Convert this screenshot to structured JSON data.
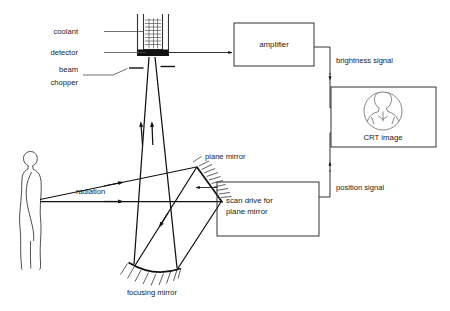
{
  "figure": {
    "background": "#ffffff",
    "ink": "#1a1a1a"
  },
  "labels": {
    "coolant": "coolant",
    "detector": "detector",
    "beam_chopper_line1": "beam",
    "beam_chopper_line2": "chopper",
    "radiation": "radiation",
    "plane_mirror": "plane mirror",
    "focusing_mirror": "focusing mirror",
    "brightness_signal": "brightness signal",
    "position_signal": "position signal"
  },
  "boxes": [
    {
      "id": "amplifier",
      "label": "amplifier",
      "x": 234,
      "y": 23,
      "width": 80,
      "height": 43
    },
    {
      "id": "crt-image",
      "label": "CRT image",
      "x": 331,
      "y": 87,
      "width": 105,
      "height": 60
    },
    {
      "id": "scan-drive",
      "label_line1": "scan drive for",
      "label_line2": "plane mirror",
      "x": 217,
      "y": 182,
      "width": 102,
      "height": 54
    }
  ],
  "components": {
    "coolant_vessel": {
      "name": "coolant vessel",
      "x": 137,
      "y": 14,
      "width": 32,
      "height": 42
    },
    "detector_bar": {
      "name": "detector bar",
      "color": "#111111"
    },
    "plane_mirror": {
      "name": "plane mirror",
      "hatched_side": "right"
    },
    "focusing_mirror": {
      "name": "focusing mirror (concave)",
      "hatched_side": "below"
    },
    "subject": {
      "name": "human subject in profile"
    },
    "crt_thermogram": {
      "name": "head and shoulders thermogram"
    }
  },
  "signal_paths": [
    {
      "id": "detector-to-amplifier",
      "from": "detector",
      "to": "amplifier",
      "label": ""
    },
    {
      "id": "amplifier-to-crt",
      "from": "amplifier",
      "to": "CRT image",
      "label": "brightness signal"
    },
    {
      "id": "scan-drive-to-crt",
      "from": "scan drive for plane mirror",
      "to": "CRT image",
      "label": "position signal"
    },
    {
      "id": "scan-drive-to-plane-mirror",
      "from": "scan drive for plane mirror",
      "to": "plane mirror",
      "label": ""
    }
  ]
}
